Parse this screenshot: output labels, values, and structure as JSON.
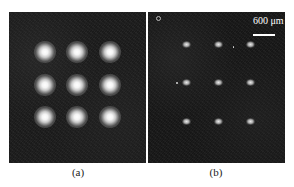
{
  "figure": {
    "panels": [
      {
        "id": "a",
        "caption": "(a)",
        "description": "3x3 array of bright round spots on dark background",
        "spots": [
          {
            "x": 45,
            "y": 52
          },
          {
            "x": 77,
            "y": 52
          },
          {
            "x": 110,
            "y": 52
          },
          {
            "x": 45,
            "y": 85
          },
          {
            "x": 77,
            "y": 85
          },
          {
            "x": 110,
            "y": 85
          },
          {
            "x": 45,
            "y": 117
          },
          {
            "x": 77,
            "y": 117
          },
          {
            "x": 110,
            "y": 117
          }
        ]
      },
      {
        "id": "b",
        "caption": "(b)",
        "description": "3x3 array of small dim spots on dark background with scale bar",
        "scale_bar_label": "600 μm",
        "spots": [
          {
            "x": 186,
            "y": 44
          },
          {
            "x": 218,
            "y": 44
          },
          {
            "x": 250,
            "y": 44
          },
          {
            "x": 186,
            "y": 82
          },
          {
            "x": 218,
            "y": 82
          },
          {
            "x": 250,
            "y": 82
          },
          {
            "x": 186,
            "y": 121
          },
          {
            "x": 218,
            "y": 121
          },
          {
            "x": 250,
            "y": 121
          }
        ]
      }
    ]
  }
}
